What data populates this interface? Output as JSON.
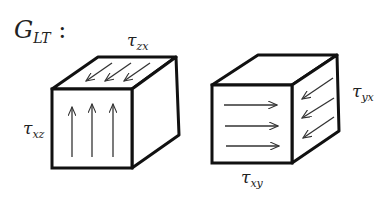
{
  "title": {
    "main": "G",
    "sub": "LT",
    "suffix": " :"
  },
  "left_cube": {
    "top_label": {
      "main": "τ",
      "sub": "zx"
    },
    "side_label": {
      "main": "τ",
      "sub": "xz"
    },
    "top_arrows": 3,
    "front_arrows": 3,
    "front_arrow_direction": "up",
    "top_arrow_direction": "toward-front-left"
  },
  "right_cube": {
    "side_label": {
      "main": "τ",
      "sub": "yx"
    },
    "bottom_label": {
      "main": "τ",
      "sub": "xy"
    },
    "front_arrows": 3,
    "side_arrows": 3,
    "front_arrow_direction": "right",
    "side_arrow_direction": "toward-front-left"
  },
  "colors": {
    "stroke": "#111111",
    "arrow": "#333333",
    "background": "#ffffff"
  }
}
